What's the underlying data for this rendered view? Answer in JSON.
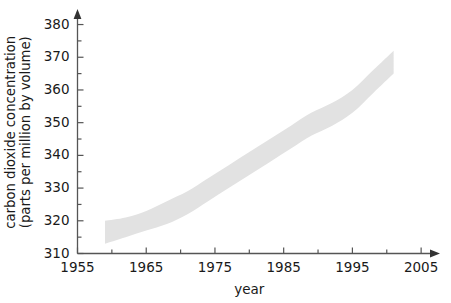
{
  "chart_data": {
    "type": "area",
    "title": "",
    "subtitle": "",
    "xlabel": "year",
    "ylabel": "carbon dioxide concentration (parts per million by volume)",
    "ylabel_line1": "carbon dioxide concentration",
    "ylabel_line2": "(parts per million by volume)",
    "xlim": [
      1955,
      2006
    ],
    "ylim": [
      310,
      382
    ],
    "xticks": [
      1955,
      1965,
      1975,
      1985,
      1995,
      2005
    ],
    "xtick_labels": [
      "1955",
      "1965",
      "1975",
      "1985",
      "1995",
      "2005"
    ],
    "xminor_ticks": [
      1960,
      1970,
      1980,
      1990,
      2000
    ],
    "yticks": [
      310,
      320,
      330,
      340,
      350,
      360,
      370,
      380
    ],
    "ytick_labels": [
      "310",
      "320",
      "330",
      "340",
      "350",
      "360",
      "370",
      "380"
    ],
    "yminor_ticks": [
      315,
      325,
      335,
      345,
      355,
      365,
      375
    ],
    "grid": false,
    "legend": false,
    "band_color": "#e2e2e2",
    "axis_color": "#555555",
    "text_color": "#1a1a1a",
    "band_width_ppm": 7,
    "series": [
      {
        "name": "carbon dioxide concentration",
        "x": [
          1959,
          1962,
          1965,
          1968,
          1971,
          1974,
          1977,
          1980,
          1983,
          1986,
          1989,
          1992,
          1995,
          1998,
          2001
        ],
        "values": [
          317,
          318,
          320,
          322,
          325,
          329,
          333,
          337,
          341,
          345,
          350,
          352,
          356,
          362,
          368
        ],
        "upper": [
          320,
          321,
          323,
          326,
          329,
          333,
          337,
          341,
          345,
          349,
          353,
          356,
          360,
          366,
          372
        ],
        "lower": [
          313,
          315,
          317,
          319,
          322,
          326,
          330,
          334,
          338,
          342,
          346,
          349,
          353,
          359,
          365
        ]
      }
    ]
  }
}
